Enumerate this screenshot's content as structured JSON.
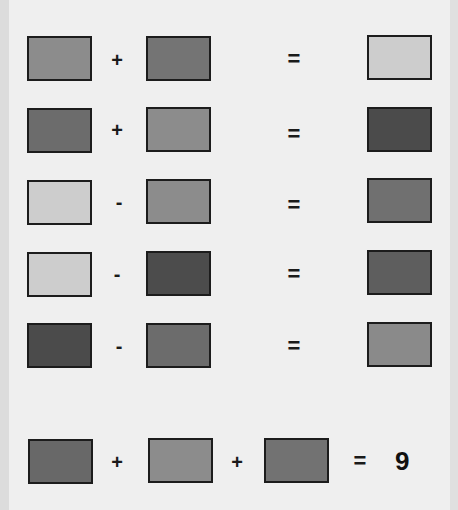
{
  "puzzle": {
    "rows": [
      {
        "operands": [
          {
            "shade": "mid-light",
            "color": "#8c8c8c"
          },
          {
            "shade": "mid",
            "color": "#747474"
          }
        ],
        "operators": [
          "+"
        ],
        "equals": "=",
        "result": {
          "shade": "light",
          "color": "#cdcdcd"
        }
      },
      {
        "operands": [
          {
            "shade": "mid",
            "color": "#6c6c6c"
          },
          {
            "shade": "mid-light",
            "color": "#8c8c8c"
          }
        ],
        "operators": [
          "+"
        ],
        "equals": "=",
        "result": {
          "shade": "dark",
          "color": "#4b4b4b"
        }
      },
      {
        "operands": [
          {
            "shade": "light",
            "color": "#cdcdcd"
          },
          {
            "shade": "mid-light",
            "color": "#8c8c8c"
          }
        ],
        "operators": [
          "-"
        ],
        "equals": "=",
        "result": {
          "shade": "mid",
          "color": "#707070"
        }
      },
      {
        "operands": [
          {
            "shade": "light",
            "color": "#cdcdcd"
          },
          {
            "shade": "dark",
            "color": "#4c4c4c"
          }
        ],
        "operators": [
          "-"
        ],
        "equals": "=",
        "result": {
          "shade": "mid-dark",
          "color": "#5e5e5e"
        }
      },
      {
        "operands": [
          {
            "shade": "dark",
            "color": "#4b4b4b"
          },
          {
            "shade": "mid",
            "color": "#6c6c6c"
          }
        ],
        "operators": [
          "-"
        ],
        "equals": "=",
        "result": {
          "shade": "mid-light",
          "color": "#8a8a8a"
        }
      }
    ],
    "question": {
      "operands": [
        {
          "shade": "mid-dark",
          "color": "#686868"
        },
        {
          "shade": "mid-light",
          "color": "#8c8c8c"
        },
        {
          "shade": "mid",
          "color": "#727272"
        }
      ],
      "operators": [
        "+",
        "+"
      ],
      "equals": "=",
      "answer": "9"
    }
  }
}
